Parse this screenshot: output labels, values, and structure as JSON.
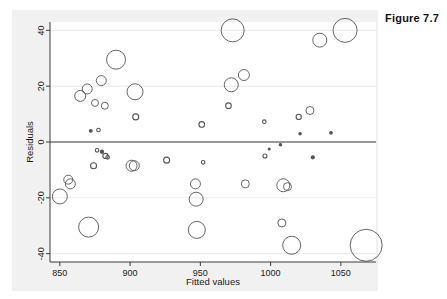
{
  "figure": {
    "caption": "Figure 7.7"
  },
  "chart_data": {
    "type": "scatter",
    "title": "",
    "subtitle": "",
    "xlabel": "Fitted values",
    "ylabel": "Residuals",
    "xlim": [
      843,
      1075
    ],
    "ylim": [
      -43,
      43
    ],
    "xticks": [
      850,
      900,
      950,
      1000,
      1050
    ],
    "yticks": [
      -40,
      -20,
      0,
      20,
      40
    ],
    "xtick_labels": [
      "850",
      "900",
      "950",
      "1000",
      "1050"
    ],
    "ytick_labels": [
      "-40",
      "-20",
      "0",
      "20",
      "40"
    ],
    "grid": "horizontal-faint",
    "legend": "none",
    "reference_lines": [
      {
        "axis": "y",
        "value": 0,
        "style": "solid",
        "color": "#333333"
      }
    ],
    "marker": {
      "style": "open-circle",
      "edge_color": "#555555",
      "fill": "none",
      "size_encodes": "weight"
    },
    "points": [
      {
        "x": 850,
        "y": -19.5,
        "r": 7.5
      },
      {
        "x": 856,
        "y": -13.5,
        "r": 4.5
      },
      {
        "x": 857.5,
        "y": -15.0,
        "r": 5.0
      },
      {
        "x": 864.5,
        "y": 16.5,
        "r": 5.5
      },
      {
        "x": 869.5,
        "y": 19.0,
        "r": 5.0
      },
      {
        "x": 870.5,
        "y": -30.5,
        "r": 10.0
      },
      {
        "x": 872,
        "y": 4.0,
        "r": 1.4
      },
      {
        "x": 874,
        "y": -8.5,
        "r": 3.0
      },
      {
        "x": 875,
        "y": 14.0,
        "r": 3.5
      },
      {
        "x": 876.5,
        "y": -3.0,
        "r": 1.8
      },
      {
        "x": 877.5,
        "y": 4.3,
        "r": 1.8
      },
      {
        "x": 879.5,
        "y": 22.0,
        "r": 5.0
      },
      {
        "x": 880,
        "y": -3.5,
        "r": 1.6
      },
      {
        "x": 882,
        "y": 13.0,
        "r": 3.5
      },
      {
        "x": 882.5,
        "y": -5.0,
        "r": 2.6
      },
      {
        "x": 884,
        "y": -5.5,
        "r": 1.8
      },
      {
        "x": 890,
        "y": 29.5,
        "r": 9.5
      },
      {
        "x": 901,
        "y": -8.5,
        "r": 5.5
      },
      {
        "x": 903,
        "y": -8.5,
        "r": 5.0
      },
      {
        "x": 903.5,
        "y": 18.0,
        "r": 8.0
      },
      {
        "x": 904,
        "y": 9.0,
        "r": 3.0
      },
      {
        "x": 926,
        "y": -6.5,
        "r": 3.0
      },
      {
        "x": 946.5,
        "y": -15.0,
        "r": 5.0
      },
      {
        "x": 947,
        "y": -20.5,
        "r": 7.0
      },
      {
        "x": 947.5,
        "y": -31.5,
        "r": 8.5
      },
      {
        "x": 951,
        "y": 6.3,
        "r": 2.8
      },
      {
        "x": 952,
        "y": -7.3,
        "r": 1.8
      },
      {
        "x": 970,
        "y": 13.0,
        "r": 2.8
      },
      {
        "x": 972,
        "y": 20.5,
        "r": 7.0
      },
      {
        "x": 973,
        "y": 40.0,
        "r": 11.5
      },
      {
        "x": 981,
        "y": 24.0,
        "r": 5.5
      },
      {
        "x": 982,
        "y": -15.0,
        "r": 4.0
      },
      {
        "x": 995.5,
        "y": 7.3,
        "r": 1.8
      },
      {
        "x": 996,
        "y": -5.0,
        "r": 2.0
      },
      {
        "x": 999,
        "y": -2.5,
        "r": 1.0
      },
      {
        "x": 1007,
        "y": -1.0,
        "r": 1.2
      },
      {
        "x": 1008,
        "y": -29.0,
        "r": 4.0
      },
      {
        "x": 1009,
        "y": -15.5,
        "r": 6.5
      },
      {
        "x": 1012,
        "y": -16.0,
        "r": 4.0
      },
      {
        "x": 1015,
        "y": -37.0,
        "r": 9.0
      },
      {
        "x": 1020,
        "y": 9.0,
        "r": 2.6
      },
      {
        "x": 1021,
        "y": 3.0,
        "r": 1.2
      },
      {
        "x": 1028,
        "y": 11.3,
        "r": 4.0
      },
      {
        "x": 1030,
        "y": -5.5,
        "r": 1.6
      },
      {
        "x": 1035,
        "y": 36.5,
        "r": 7.0
      },
      {
        "x": 1043,
        "y": 3.3,
        "r": 1.3
      },
      {
        "x": 1053,
        "y": 40.0,
        "r": 12.0
      },
      {
        "x": 1068,
        "y": -37.0,
        "r": 16.0
      }
    ]
  }
}
